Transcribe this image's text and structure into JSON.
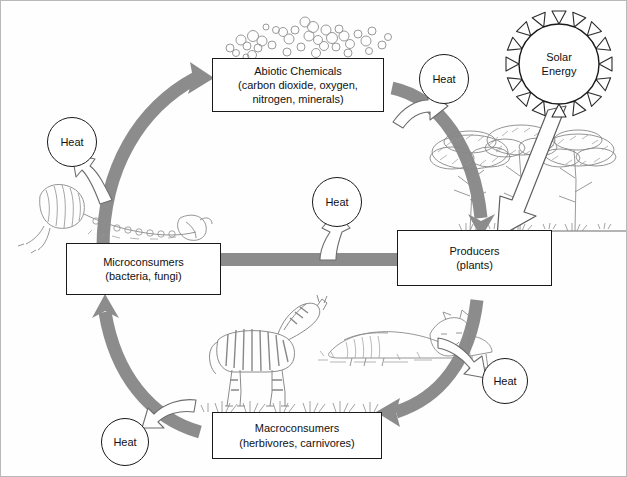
{
  "diagram": {
    "colors": {
      "cycle_arrow": "#8c8c8c",
      "cycle_arrow_dark": "#7a7a7a",
      "outline": "#1a1a1a",
      "frame": "#b9b9b9",
      "background": "#fefefe",
      "hollow_arrow_fill": "#ffffff",
      "hollow_arrow_stroke": "#6d6d6d",
      "illustration": "#8f8f8f"
    },
    "nodes": [
      {
        "id": "abiotic",
        "line1": "Abiotic Chemicals",
        "line2": "(carbon dioxide, oxygen,",
        "line3": "nitrogen, minerals)"
      },
      {
        "id": "producers",
        "line1": "Producers",
        "line2": "(plants)",
        "line3": ""
      },
      {
        "id": "microconsumers",
        "line1": "Microconsumers",
        "line2": "(bacteria, fungi)",
        "line3": ""
      },
      {
        "id": "macroconsumers",
        "line1": "Macroconsumers",
        "line2": "(herbivores, carnivores)",
        "line3": ""
      }
    ],
    "sun": {
      "line1": "Solar",
      "line2": "Energy",
      "rays": 16
    },
    "heat_labels": [
      {
        "id": "heat-top-right",
        "label": "Heat"
      },
      {
        "id": "heat-left",
        "label": "Heat"
      },
      {
        "id": "heat-center",
        "label": "Heat"
      },
      {
        "id": "heat-bottom-right",
        "label": "Heat"
      },
      {
        "id": "heat-bottom-left",
        "label": "Heat"
      }
    ],
    "flows": [
      {
        "from": "microconsumers",
        "to": "abiotic",
        "style": "thick-gray-curve"
      },
      {
        "from": "abiotic",
        "to": "producers",
        "style": "thick-gray-curve"
      },
      {
        "from": "producers",
        "to": "microconsumers",
        "style": "thick-gray-straight"
      },
      {
        "from": "producers",
        "to": "macroconsumers",
        "style": "thick-gray-curve"
      },
      {
        "from": "macroconsumers",
        "to": "microconsumers",
        "style": "thick-gray-curve"
      },
      {
        "from": "sun",
        "to": "producers",
        "style": "hollow-white-arrow"
      },
      {
        "from": "producers",
        "to": "heat-top-right",
        "style": "hollow-outline-arrow"
      },
      {
        "from": "microconsumers",
        "to": "heat-left",
        "style": "hollow-outline-arrow"
      },
      {
        "from": "cycle",
        "to": "heat-center",
        "style": "hollow-outline-arrow"
      },
      {
        "from": "macroconsumers",
        "to": "heat-bottom-right",
        "style": "hollow-outline-arrow"
      },
      {
        "from": "macroconsumers",
        "to": "heat-bottom-left",
        "style": "hollow-outline-arrow"
      }
    ],
    "illustrations": [
      {
        "id": "molecules",
        "name": "chemical-molecule-bubbles"
      },
      {
        "id": "trees",
        "name": "acacia-trees"
      },
      {
        "id": "zebra",
        "name": "zebra"
      },
      {
        "id": "lion-carcass",
        "name": "lion-and-carcass"
      },
      {
        "id": "bones",
        "name": "decomposing-skeleton"
      },
      {
        "id": "grass",
        "name": "grass-tufts"
      }
    ]
  }
}
